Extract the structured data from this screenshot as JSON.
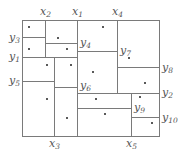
{
  "diagram": {
    "type": "rectangular-subdivision",
    "outer_box": {
      "x1": 22,
      "y1": 20,
      "x2": 159,
      "y2": 136
    },
    "segments": [
      {
        "name": "x2",
        "orient": "v",
        "x": 45,
        "y1": 20,
        "y2": 57
      },
      {
        "name": "x1",
        "orient": "v",
        "x": 77,
        "y1": 20,
        "y2": 136
      },
      {
        "name": "x4",
        "orient": "v",
        "x": 117,
        "y1": 20,
        "y2": 93
      },
      {
        "name": "x3",
        "orient": "v",
        "x": 54,
        "y1": 57,
        "y2": 136
      },
      {
        "name": "x5",
        "orient": "v",
        "x": 131,
        "y1": 93,
        "y2": 136
      },
      {
        "name": "y3",
        "orient": "h",
        "y": 37,
        "x1": 22,
        "x2": 45
      },
      {
        "name": "y4",
        "orient": "h",
        "y": 43,
        "x1": 45,
        "x2": 77
      },
      {
        "name": "y1",
        "orient": "h",
        "y": 57,
        "x1": 22,
        "x2": 77
      },
      {
        "name": "y7",
        "orient": "h",
        "y": 51,
        "x1": 77,
        "x2": 117
      },
      {
        "name": "y8",
        "orient": "h",
        "y": 67,
        "x1": 117,
        "x2": 159
      },
      {
        "name": "y5",
        "orient": "h",
        "y": 81,
        "x1": 22,
        "x2": 54
      },
      {
        "name": "y6",
        "orient": "h",
        "y": 87,
        "x1": 54,
        "x2": 77
      },
      {
        "name": "y2",
        "orient": "h",
        "y": 93,
        "x1": 77,
        "x2": 159
      },
      {
        "name": "y9",
        "orient": "h",
        "y": 108,
        "x1": 77,
        "x2": 131
      },
      {
        "name": "y10",
        "orient": "h",
        "y": 117,
        "x1": 131,
        "x2": 159
      }
    ],
    "labels": [
      {
        "base": "x",
        "sub": "2",
        "x": 40,
        "y": 15
      },
      {
        "base": "x",
        "sub": "1",
        "x": 72,
        "y": 15
      },
      {
        "base": "x",
        "sub": "4",
        "x": 112,
        "y": 15
      },
      {
        "base": "y",
        "sub": "3",
        "x": 9,
        "y": 41
      },
      {
        "base": "y",
        "sub": "4",
        "x": 80,
        "y": 46
      },
      {
        "base": "y",
        "sub": "1",
        "x": 9,
        "y": 60
      },
      {
        "base": "y",
        "sub": "7",
        "x": 120,
        "y": 54
      },
      {
        "base": "y",
        "sub": "8",
        "x": 162,
        "y": 71
      },
      {
        "base": "y",
        "sub": "5",
        "x": 9,
        "y": 84
      },
      {
        "base": "y",
        "sub": "6",
        "x": 80,
        "y": 89
      },
      {
        "base": "y",
        "sub": "2",
        "x": 162,
        "y": 96
      },
      {
        "base": "y",
        "sub": "9",
        "x": 134,
        "y": 111
      },
      {
        "base": "y",
        "sub": "10",
        "x": 162,
        "y": 121
      },
      {
        "base": "x",
        "sub": "3",
        "x": 49,
        "y": 147
      },
      {
        "base": "x",
        "sub": "5",
        "x": 126,
        "y": 147
      }
    ],
    "points": [
      [
        29,
        27
      ],
      [
        58,
        38
      ],
      [
        29,
        49
      ],
      [
        67,
        49
      ],
      [
        47,
        65
      ],
      [
        71,
        65
      ],
      [
        93,
        72
      ],
      [
        103,
        27
      ],
      [
        129,
        58
      ],
      [
        145,
        83
      ],
      [
        47,
        99
      ],
      [
        67,
        118
      ],
      [
        96,
        99
      ],
      [
        105,
        114
      ],
      [
        140,
        97
      ],
      [
        152,
        123
      ]
    ]
  }
}
